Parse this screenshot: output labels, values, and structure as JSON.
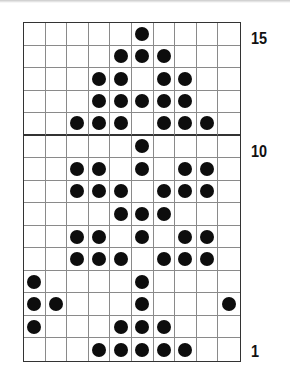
{
  "chart": {
    "columns": 10,
    "rows": 15,
    "row_labels": [
      {
        "row": 15,
        "label": "15"
      },
      {
        "row": 10,
        "label": "10"
      },
      {
        "row": 1,
        "label": "1"
      }
    ],
    "divider_after_row": 11,
    "dot_color": "#0d0d0d",
    "grid_color": "#8a8a8a",
    "pattern": {
      "15": [
        6
      ],
      "14": [
        5,
        6,
        7
      ],
      "13": [
        4,
        5,
        7,
        8
      ],
      "12": [
        4,
        5,
        6,
        7,
        8
      ],
      "11": [
        3,
        4,
        5,
        7,
        8,
        9
      ],
      "10": [
        6
      ],
      "9": [
        3,
        4,
        6,
        8,
        9
      ],
      "8": [
        3,
        4,
        5,
        7,
        8,
        9
      ],
      "7": [
        5,
        6,
        7
      ],
      "6": [
        3,
        4,
        6,
        8,
        9
      ],
      "5": [
        3,
        4,
        5,
        7,
        8,
        9
      ],
      "4": [
        1,
        6
      ],
      "3": [
        1,
        2,
        6,
        10
      ],
      "2": [
        1,
        5,
        6,
        7
      ],
      "1": [
        4,
        5,
        6,
        7,
        8
      ]
    }
  }
}
